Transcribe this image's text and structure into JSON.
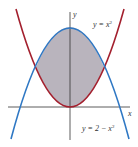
{
  "figure": {
    "axes": {
      "x_label": "x",
      "y_label": "y"
    },
    "curves": [
      {
        "name": "upper-parabola",
        "equation_label": "y = x²",
        "label_prefix": "y = x",
        "label_exp": "2",
        "color": "#a3202e"
      },
      {
        "name": "lower-parabola",
        "equation_label": "y = 2 − x²",
        "label_prefix": "y = 2 − x",
        "label_exp": "2",
        "color": "#2f78c4"
      }
    ],
    "shaded_region": {
      "color": "#b9b4bd",
      "between": [
        "y = x²",
        "y = 2 − x²"
      ],
      "x_range": [
        -1,
        1
      ]
    },
    "intersections": [
      [
        -1,
        1
      ],
      [
        1,
        1
      ]
    ],
    "axis_color": "#333333"
  }
}
